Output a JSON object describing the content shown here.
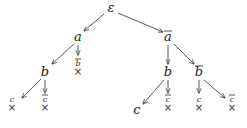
{
  "diagram": {
    "type": "tree",
    "nodes": [
      {
        "id": "root",
        "label": "ε",
        "overline": false,
        "x": 111,
        "y": 12,
        "size": "big",
        "closed": false
      },
      {
        "id": "a",
        "label": "a",
        "overline": false,
        "x": 78,
        "y": 41,
        "size": "big",
        "closed": false
      },
      {
        "id": "abar",
        "label": "a",
        "overline": true,
        "x": 168,
        "y": 41,
        "size": "big",
        "closed": false
      },
      {
        "id": "a_bbar",
        "label": "b",
        "overline": true,
        "x": 78,
        "y": 66,
        "size": "small",
        "closed": true
      },
      {
        "id": "a_b",
        "label": "b",
        "overline": false,
        "x": 45,
        "y": 76,
        "size": "big",
        "closed": false
      },
      {
        "id": "a_b_c",
        "label": "c",
        "overline": false,
        "x": 12,
        "y": 102,
        "size": "small",
        "closed": true
      },
      {
        "id": "a_b_cbar",
        "label": "c",
        "overline": true,
        "x": 45,
        "y": 102,
        "size": "small",
        "closed": true
      },
      {
        "id": "abar_b",
        "label": "b",
        "overline": false,
        "x": 168,
        "y": 76,
        "size": "big",
        "closed": false
      },
      {
        "id": "abar_bbar",
        "label": "b",
        "overline": true,
        "x": 199,
        "y": 76,
        "size": "big",
        "closed": false
      },
      {
        "id": "abar_b_c",
        "label": "c",
        "overline": false,
        "x": 137,
        "y": 114,
        "size": "big",
        "closed": false
      },
      {
        "id": "abar_b_cbar",
        "label": "c",
        "overline": true,
        "x": 168,
        "y": 102,
        "size": "small",
        "closed": true
      },
      {
        "id": "abar_bbar_c",
        "label": "c",
        "overline": false,
        "x": 199,
        "y": 102,
        "size": "small",
        "closed": true
      },
      {
        "id": "abar_bbar_cbar",
        "label": "c",
        "overline": true,
        "x": 232,
        "y": 102,
        "size": "small",
        "closed": true
      }
    ],
    "edges": [
      {
        "from": "root",
        "to": "a",
        "x1": 104,
        "y1": 14,
        "x2": 84,
        "y2": 31
      },
      {
        "from": "root",
        "to": "abar",
        "x1": 118,
        "y1": 13,
        "x2": 163,
        "y2": 32
      },
      {
        "from": "a",
        "to": "a_b",
        "x1": 74,
        "y1": 44,
        "x2": 52,
        "y2": 64
      },
      {
        "from": "a",
        "to": "a_bbar",
        "x1": 78,
        "y1": 45,
        "x2": 78,
        "y2": 55
      },
      {
        "from": "a_b",
        "to": "a_b_c",
        "x1": 41,
        "y1": 79,
        "x2": 22,
        "y2": 98
      },
      {
        "from": "a_b",
        "to": "a_b_cbar",
        "x1": 45,
        "y1": 80,
        "x2": 45,
        "y2": 93
      },
      {
        "from": "abar",
        "to": "abar_b",
        "x1": 168,
        "y1": 45,
        "x2": 168,
        "y2": 64
      },
      {
        "from": "abar",
        "to": "abar_bbar",
        "x1": 174,
        "y1": 44,
        "x2": 194,
        "y2": 64
      },
      {
        "from": "abar_b",
        "to": "abar_b_c",
        "x1": 164,
        "y1": 80,
        "x2": 143,
        "y2": 104
      },
      {
        "from": "abar_b",
        "to": "abar_b_cbar",
        "x1": 168,
        "y1": 80,
        "x2": 168,
        "y2": 93
      },
      {
        "from": "abar_bbar",
        "to": "abar_bbar_c",
        "x1": 199,
        "y1": 80,
        "x2": 199,
        "y2": 93
      },
      {
        "from": "abar_bbar",
        "to": "abar_bbar_cbar",
        "x1": 204,
        "y1": 80,
        "x2": 225,
        "y2": 98
      }
    ],
    "closed_marker": "×"
  }
}
